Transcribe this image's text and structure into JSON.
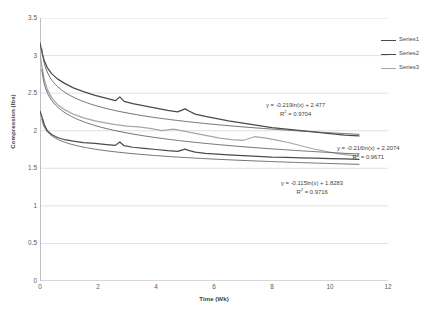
{
  "chart_data": {
    "type": "line",
    "title": "",
    "xlabel": "Time (Wk)",
    "ylabel": "Compression (lbs)",
    "xlim": [
      0,
      12
    ],
    "ylim": [
      0,
      3.5
    ],
    "xticks": [
      0,
      2,
      4,
      6,
      8,
      10,
      12
    ],
    "yticks": [
      0,
      0.5,
      1,
      1.5,
      2,
      2.5,
      3,
      3.5
    ],
    "grid": "horizontal",
    "legend_position": "right",
    "series": [
      {
        "name": "Series1",
        "color": "#4a4a4a",
        "x": [
          0,
          0.08,
          0.15,
          0.25,
          0.4,
          0.6,
          0.85,
          1.15,
          1.5,
          1.9,
          2.3,
          2.6,
          2.75,
          2.9,
          3.2,
          3.6,
          4.0,
          4.4,
          4.75,
          5.0,
          5.15,
          5.35,
          5.7,
          6.1,
          6.5,
          7.0,
          7.5,
          8.0,
          8.5,
          9.0,
          9.5,
          10.0,
          10.5,
          11.0
        ],
        "y": [
          3.17,
          3.02,
          2.93,
          2.84,
          2.76,
          2.69,
          2.63,
          2.57,
          2.52,
          2.47,
          2.43,
          2.4,
          2.45,
          2.39,
          2.36,
          2.33,
          2.3,
          2.27,
          2.25,
          2.29,
          2.26,
          2.22,
          2.19,
          2.16,
          2.13,
          2.1,
          2.07,
          2.04,
          2.02,
          2.0,
          1.98,
          1.96,
          1.94,
          1.93
        ]
      },
      {
        "name": "Series2",
        "color": "#4a4a4a",
        "x": [
          0,
          0.08,
          0.15,
          0.25,
          0.4,
          0.6,
          0.85,
          1.15,
          1.5,
          1.9,
          2.3,
          2.6,
          2.75,
          2.9,
          3.2,
          3.6,
          4.0,
          4.4,
          4.75,
          5.0,
          5.15,
          5.35,
          5.7,
          6.1,
          6.5,
          7.0,
          7.5,
          8.0,
          8.5,
          9.0,
          9.5,
          10.0,
          10.5,
          11.0
        ],
        "y": [
          2.26,
          2.17,
          2.08,
          2.0,
          1.95,
          1.91,
          1.88,
          1.86,
          1.84,
          1.83,
          1.815,
          1.805,
          1.85,
          1.8,
          1.78,
          1.765,
          1.75,
          1.735,
          1.725,
          1.755,
          1.735,
          1.715,
          1.7,
          1.69,
          1.68,
          1.67,
          1.66,
          1.65,
          1.645,
          1.64,
          1.635,
          1.63,
          1.625,
          1.62
        ]
      },
      {
        "name": "Series3",
        "color": "#a6a6a6",
        "x": [
          0,
          0.08,
          0.15,
          0.25,
          0.4,
          0.6,
          0.85,
          1.15,
          1.5,
          1.9,
          2.3,
          2.6,
          3.0,
          3.4,
          3.8,
          4.2,
          4.6,
          5.0,
          5.4,
          5.8,
          6.2,
          6.6,
          7.0,
          7.4,
          7.8,
          8.2,
          8.6,
          9.0,
          9.4,
          9.8,
          10.2,
          10.6,
          11.0
        ],
        "y": [
          3.02,
          2.82,
          2.68,
          2.55,
          2.44,
          2.35,
          2.28,
          2.22,
          2.17,
          2.13,
          2.1,
          2.08,
          2.06,
          2.05,
          2.03,
          2.0,
          2.02,
          1.99,
          1.96,
          1.93,
          1.9,
          1.88,
          1.87,
          1.92,
          1.9,
          1.87,
          1.84,
          1.8,
          1.76,
          1.73,
          1.7,
          1.68,
          1.66
        ]
      }
    ],
    "trendlines": [
      {
        "name": "trendline-series1",
        "color": "#595959",
        "equation": "y = -0.219ln(x) + 2.477",
        "r2_label": "R",
        "r2_exp": "2",
        "r2_value": " = 0.9704",
        "a": -0.219,
        "b": 2.477
      },
      {
        "name": "trendline-series3",
        "color": "#595959",
        "equation": "y = -0.216ln(x) + 2.2074",
        "r2_label": "R",
        "r2_exp": "2",
        "r2_value": " = 0.9671",
        "a": -0.216,
        "b": 2.2074
      },
      {
        "name": "trendline-series2",
        "color": "#595959",
        "equation": "y = -0.115ln(x) + 1.8283",
        "r2_label": "R",
        "r2_exp": "2",
        "r2_value": " = 0.9716",
        "a": -0.115,
        "b": 1.8283
      }
    ]
  },
  "axes": {
    "y_title": "Compression (lbs)",
    "x_title": "Time (Wk)",
    "y_tick_labels": [
      "0",
      "0.5",
      "1",
      "1.5",
      "2",
      "2.5",
      "3",
      "3.5"
    ],
    "x_tick_labels": [
      "0",
      "2",
      "4",
      "6",
      "8",
      "10",
      "12"
    ]
  },
  "legend": {
    "items": [
      {
        "label": "Series1",
        "color": "#4a4a4a"
      },
      {
        "label": "Series2",
        "color": "#4a4a4a"
      },
      {
        "label": "Series3",
        "color": "#a6a6a6"
      }
    ]
  },
  "annotations": {
    "eq1_line1": "y = -0.219ln(x) + 2.477",
    "eq1_line2_pre": "R",
    "eq1_line2_sup": "2",
    "eq1_line2_post": " = 0.9704",
    "eq2_line1": "y = -0.216ln(x) + 2.2074",
    "eq2_line2_pre": "R",
    "eq2_line2_sup": "2",
    "eq2_line2_post": " = 0.9671",
    "eq3_line1": "y = -0.115ln(x) + 1.8283",
    "eq3_line2_pre": "R",
    "eq3_line2_sup": "2",
    "eq3_line2_post": " = 0.9716"
  },
  "colors": {
    "grid": "#d9d9d9",
    "axis": "#bfbfbf",
    "text": "#595959",
    "series_dark": "#4a4a4a",
    "series_light": "#a6a6a6",
    "trend": "#595959"
  }
}
